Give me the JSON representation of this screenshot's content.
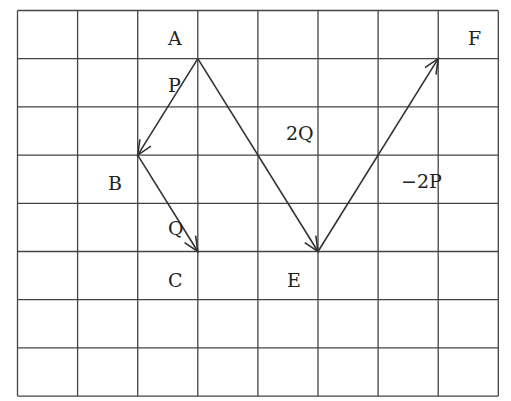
{
  "diagram": {
    "grid": {
      "cols": 8,
      "rows": 8,
      "left": 17.5,
      "top": 10.5,
      "cell_w": 60.1,
      "cell_h": 48.2,
      "line_color": "#444444"
    },
    "points": [
      {
        "id": "A",
        "label": "A",
        "gx": 3,
        "gy": 1,
        "label_x": 168,
        "label_y": 45
      },
      {
        "id": "B",
        "label": "B",
        "gx": 2,
        "gy": 3,
        "label_x": 108,
        "label_y": 190
      },
      {
        "id": "C",
        "label": "C",
        "gx": 3,
        "gy": 5,
        "label_x": 168,
        "label_y": 287
      },
      {
        "id": "E",
        "label": "E",
        "gx": 5,
        "gy": 5,
        "label_x": 287,
        "label_y": 287
      },
      {
        "id": "F",
        "label": "F",
        "gx": 7,
        "gy": 1,
        "label_x": 468,
        "label_y": 45
      }
    ],
    "vectors": [
      {
        "id": "P",
        "label": "P",
        "from": [
          3,
          1
        ],
        "to": [
          2,
          3
        ],
        "label_x": 168,
        "label_y": 92
      },
      {
        "id": "Q",
        "label": "Q",
        "from": [
          2,
          3
        ],
        "to": [
          3,
          5
        ],
        "label_x": 168,
        "label_y": 235
      },
      {
        "id": "2Q",
        "label": "2Q",
        "from": [
          3,
          1
        ],
        "to": [
          5,
          5
        ],
        "label_x": 286,
        "label_y": 140
      },
      {
        "id": "-2P",
        "label": "−2P",
        "from": [
          5,
          5
        ],
        "to": [
          7,
          1
        ],
        "label_x": 401,
        "label_y": 188
      }
    ]
  }
}
